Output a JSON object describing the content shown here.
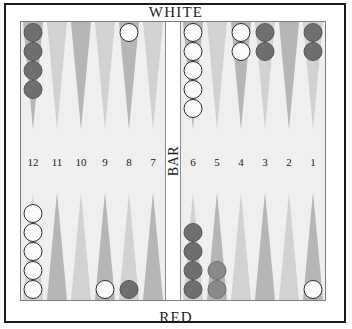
{
  "board": {
    "top_player_label": "WHITE",
    "bottom_player_label": "RED",
    "bar_label": "BAR",
    "colors": {
      "frame": "#1a1a1a",
      "board_background": "#efefef",
      "point_dark": "#b6b6b6",
      "point_light": "#d2d2d2",
      "checker_white": "#fbfbfb",
      "checker_red": "#8a8a8a",
      "checker_red_dark": "#6f6f6f",
      "text": "#1c1c1c"
    },
    "point_numbers_left": [
      "12",
      "11",
      "10",
      "9",
      "8",
      "7"
    ],
    "point_numbers_right": [
      "6",
      "5",
      "4",
      "3",
      "2",
      "1"
    ],
    "quadrants": {
      "top_left": [
        {
          "point": "12",
          "checkers": [
            {
              "color": "red",
              "shade": "dark"
            },
            {
              "color": "red",
              "shade": "dark"
            },
            {
              "color": "red",
              "shade": "dark"
            },
            {
              "color": "red",
              "shade": "dark"
            }
          ]
        },
        {
          "point": "11",
          "checkers": []
        },
        {
          "point": "10",
          "checkers": []
        },
        {
          "point": "9",
          "checkers": []
        },
        {
          "point": "8",
          "checkers": [
            {
              "color": "white",
              "shade": ""
            }
          ]
        },
        {
          "point": "7",
          "checkers": []
        }
      ],
      "top_right": [
        {
          "point": "6",
          "checkers": [
            {
              "color": "white",
              "shade": ""
            },
            {
              "color": "white",
              "shade": ""
            },
            {
              "color": "white",
              "shade": ""
            },
            {
              "color": "white",
              "shade": ""
            },
            {
              "color": "white",
              "shade": ""
            }
          ]
        },
        {
          "point": "5",
          "checkers": []
        },
        {
          "point": "4",
          "checkers": [
            {
              "color": "white",
              "shade": ""
            },
            {
              "color": "white",
              "shade": ""
            }
          ]
        },
        {
          "point": "3",
          "checkers": [
            {
              "color": "red",
              "shade": "dark"
            },
            {
              "color": "red",
              "shade": "dark"
            }
          ]
        },
        {
          "point": "2",
          "checkers": []
        },
        {
          "point": "1",
          "checkers": [
            {
              "color": "red",
              "shade": "dark"
            },
            {
              "color": "red",
              "shade": "dark"
            }
          ]
        }
      ],
      "bottom_left": [
        {
          "point": "13",
          "checkers": [
            {
              "color": "white",
              "shade": ""
            },
            {
              "color": "white",
              "shade": ""
            },
            {
              "color": "white",
              "shade": ""
            },
            {
              "color": "white",
              "shade": ""
            },
            {
              "color": "white",
              "shade": ""
            }
          ]
        },
        {
          "point": "14",
          "checkers": []
        },
        {
          "point": "15",
          "checkers": []
        },
        {
          "point": "16",
          "checkers": [
            {
              "color": "white",
              "shade": ""
            }
          ]
        },
        {
          "point": "17",
          "checkers": [
            {
              "color": "red",
              "shade": "dark"
            }
          ]
        },
        {
          "point": "18",
          "checkers": []
        }
      ],
      "bottom_right": [
        {
          "point": "19",
          "checkers": [
            {
              "color": "red",
              "shade": "dark"
            },
            {
              "color": "red",
              "shade": "dark"
            },
            {
              "color": "red",
              "shade": "dark"
            },
            {
              "color": "red",
              "shade": "dark"
            }
          ]
        },
        {
          "point": "20",
          "checkers": [
            {
              "color": "red",
              "shade": ""
            },
            {
              "color": "red",
              "shade": ""
            }
          ]
        },
        {
          "point": "21",
          "checkers": []
        },
        {
          "point": "22",
          "checkers": []
        },
        {
          "point": "23",
          "checkers": []
        },
        {
          "point": "24",
          "checkers": [
            {
              "color": "white",
              "shade": ""
            }
          ]
        }
      ]
    }
  }
}
